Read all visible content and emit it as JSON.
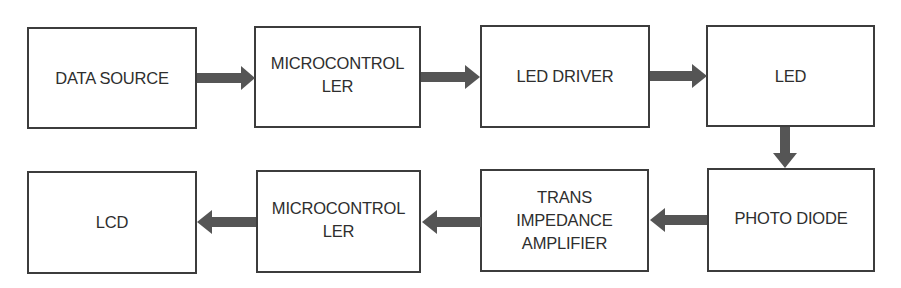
{
  "diagram": {
    "type": "block-diagram",
    "arrow_color": "#555555",
    "border_color": "#3c3c3c",
    "text_color": "#2e2e2e",
    "top_row": [
      {
        "id": "data_source",
        "label": "DATA SOURCE"
      },
      {
        "id": "microcontroller_tx",
        "label": "MICROCONTROL\nLER"
      },
      {
        "id": "led_driver",
        "label": "LED DRIVER"
      },
      {
        "id": "led",
        "label": "LED"
      }
    ],
    "bottom_row": [
      {
        "id": "lcd",
        "label": "LCD"
      },
      {
        "id": "microcontroller_rx",
        "label": "MICROCONTROL\nLER"
      },
      {
        "id": "trans_impedance_amplifier",
        "label": "TRANS\nIMPEDANCE\nAMPLIFIER"
      },
      {
        "id": "photo_diode",
        "label": "PHOTO DIODE"
      }
    ],
    "edges": [
      {
        "from": "data_source",
        "to": "microcontroller_tx",
        "direction": "right"
      },
      {
        "from": "microcontroller_tx",
        "to": "led_driver",
        "direction": "right"
      },
      {
        "from": "led_driver",
        "to": "led",
        "direction": "right"
      },
      {
        "from": "led",
        "to": "photo_diode",
        "direction": "down"
      },
      {
        "from": "photo_diode",
        "to": "trans_impedance_amplifier",
        "direction": "left"
      },
      {
        "from": "trans_impedance_amplifier",
        "to": "microcontroller_rx",
        "direction": "left"
      },
      {
        "from": "microcontroller_rx",
        "to": "lcd",
        "direction": "left"
      }
    ]
  }
}
